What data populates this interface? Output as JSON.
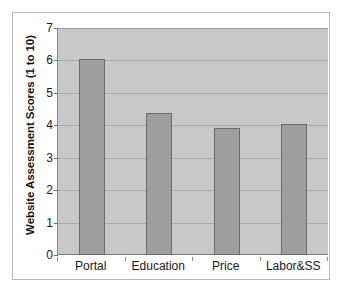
{
  "chart_data": {
    "type": "bar",
    "title": "",
    "xlabel": "",
    "ylabel": "Website Assessment Scores (1 to 10)",
    "categories": [
      "Portal",
      "Education",
      "Price",
      "Labor&SS"
    ],
    "values": [
      6.03,
      4.37,
      3.92,
      4.03
    ],
    "ylim": [
      0,
      7
    ],
    "ytick_labels": [
      "0",
      "1",
      "2",
      "3",
      "4",
      "5",
      "6",
      "7"
    ],
    "ytick_values": [
      0,
      1,
      2,
      3,
      4,
      5,
      6,
      7
    ],
    "grid": true,
    "legend": "none",
    "colors": {
      "bar_fill": "#9e9e9e",
      "bar_border": "#6b6b6b",
      "plot_background": "#c8c8c8",
      "gridline": "#a9a9a9",
      "figure_background": "#ffffff",
      "figure_border": "#b9b9b9",
      "text": "#1a1a1a"
    }
  }
}
